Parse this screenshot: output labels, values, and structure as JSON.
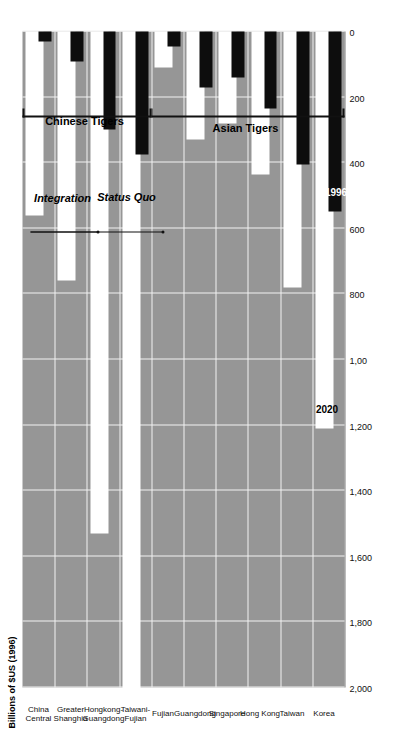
{
  "chart_data": {
    "type": "bar",
    "orientation": "horizontal",
    "title": "",
    "xlabel": "",
    "ylabel": "Billions of $US (1996)",
    "axis_title": "Billions of $US (1996)",
    "tick_labels": [
      "2,000",
      "1,800",
      "1,600",
      "1,400",
      "1,200",
      "1,00",
      "800",
      "600",
      "400",
      "200",
      "0"
    ],
    "tick_values": [
      2000,
      1800,
      1600,
      1400,
      1200,
      1000,
      800,
      600,
      400,
      200,
      0
    ],
    "xlim": [
      0,
      2000
    ],
    "grid": true,
    "legend_position": "none",
    "categories": [
      "Korea",
      "Taiwan",
      "Hong Kong",
      "Singapore",
      "Guangdong",
      "Fujian",
      "Taiwani-\nFujian",
      "Hongkong-\nGuangdong",
      "Greater\nShanghia",
      "China\nCentral"
    ],
    "series": [
      {
        "name": "1996",
        "color": "#0d0d0d",
        "values": [
          550,
          405,
          235,
          140,
          170,
          45,
          375,
          300,
          90,
          30
        ]
      },
      {
        "name": "2020",
        "color": "#ffffff",
        "values": [
          1210,
          780,
          435,
          280,
          330,
          110,
          2010,
          1530,
          760,
          560
        ]
      }
    ],
    "data_labels": [
      {
        "text": "2020",
        "category": "Korea",
        "series": "2020",
        "style": "dark"
      },
      {
        "text": "1996",
        "category": "Korea",
        "series": "1996",
        "style": "light"
      }
    ],
    "group_brackets": [
      {
        "label": "Asian Tigers",
        "from": "Korea",
        "to": "Fujian"
      },
      {
        "label": "Chinese Tigers",
        "from": "Taiwani-\nFujian",
        "to": "China\nCentral"
      }
    ],
    "annotations": [
      {
        "label": "Status Quo",
        "target": "Fujian"
      },
      {
        "label": "Integration",
        "target": "Hongkong-\nGuangdong"
      }
    ],
    "colors": {
      "plot_background": "#969696",
      "gridline": "#f2f2f2",
      "bar_1996": "#0d0d0d",
      "bar_2020": "#ffffff",
      "text": "#111111"
    }
  }
}
